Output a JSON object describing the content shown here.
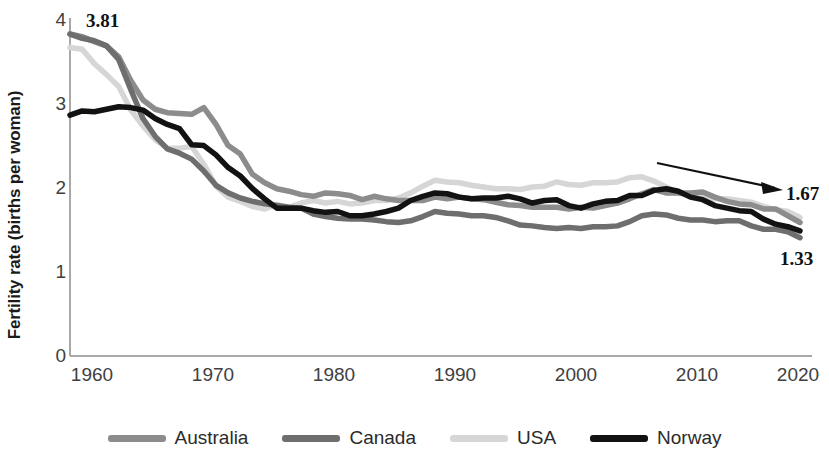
{
  "chart_data": {
    "type": "line",
    "title": "",
    "xlabel": "",
    "ylabel": "Fertility rate (births per woman)",
    "xlim": [
      1960,
      2020
    ],
    "ylim": [
      0,
      4
    ],
    "xticks": [
      "1960",
      "1970",
      "1980",
      "1990",
      "2000",
      "2010",
      "2020"
    ],
    "yticks": [
      "0",
      "1",
      "2",
      "3",
      "4"
    ],
    "grid": false,
    "legend_position": "bottom",
    "x": [
      1960,
      1961,
      1962,
      1963,
      1964,
      1965,
      1966,
      1967,
      1968,
      1969,
      1970,
      1971,
      1972,
      1973,
      1974,
      1975,
      1976,
      1977,
      1978,
      1979,
      1980,
      1981,
      1982,
      1983,
      1984,
      1985,
      1986,
      1987,
      1988,
      1989,
      1990,
      1991,
      1992,
      1993,
      1994,
      1995,
      1996,
      1997,
      1998,
      1999,
      2000,
      2001,
      2002,
      2003,
      2004,
      2005,
      2006,
      2007,
      2008,
      2009,
      2010,
      2011,
      2012,
      2013,
      2014,
      2015,
      2016,
      2017,
      2018,
      2019,
      2020
    ],
    "series": [
      {
        "name": "Australia",
        "color": "#8c8c8c",
        "values": [
          3.81,
          3.78,
          3.72,
          3.67,
          3.54,
          3.26,
          3.03,
          2.92,
          2.88,
          2.87,
          2.86,
          2.94,
          2.74,
          2.49,
          2.39,
          2.15,
          2.05,
          1.98,
          1.95,
          1.91,
          1.89,
          1.93,
          1.92,
          1.9,
          1.85,
          1.89,
          1.86,
          1.84,
          1.84,
          1.84,
          1.88,
          1.86,
          1.88,
          1.86,
          1.85,
          1.82,
          1.79,
          1.78,
          1.76,
          1.76,
          1.76,
          1.74,
          1.76,
          1.75,
          1.78,
          1.81,
          1.86,
          1.92,
          1.97,
          1.93,
          1.93,
          1.93,
          1.94,
          1.88,
          1.83,
          1.8,
          1.79,
          1.74,
          1.74,
          1.66,
          1.58
        ]
      },
      {
        "name": "Canada",
        "color": "#6e6e6e",
        "values": [
          3.81,
          3.76,
          3.73,
          3.67,
          3.51,
          3.15,
          2.81,
          2.6,
          2.45,
          2.4,
          2.33,
          2.19,
          2.02,
          1.93,
          1.87,
          1.83,
          1.8,
          1.78,
          1.76,
          1.75,
          1.68,
          1.65,
          1.63,
          1.62,
          1.62,
          1.61,
          1.59,
          1.58,
          1.6,
          1.65,
          1.71,
          1.69,
          1.68,
          1.66,
          1.66,
          1.64,
          1.6,
          1.55,
          1.54,
          1.52,
          1.51,
          1.52,
          1.51,
          1.53,
          1.53,
          1.54,
          1.59,
          1.66,
          1.68,
          1.67,
          1.63,
          1.61,
          1.61,
          1.59,
          1.6,
          1.6,
          1.54,
          1.5,
          1.5,
          1.47,
          1.4
        ]
      },
      {
        "name": "USA",
        "color": "#d6d6d6",
        "values": [
          3.65,
          3.63,
          3.46,
          3.33,
          3.19,
          2.91,
          2.72,
          2.56,
          2.46,
          2.46,
          2.48,
          2.27,
          2.01,
          1.88,
          1.83,
          1.77,
          1.74,
          1.79,
          1.76,
          1.81,
          1.84,
          1.81,
          1.83,
          1.8,
          1.81,
          1.84,
          1.84,
          1.87,
          1.93,
          2.01,
          2.08,
          2.06,
          2.05,
          2.02,
          2.0,
          1.98,
          1.98,
          1.97,
          2.0,
          2.01,
          2.06,
          2.03,
          2.02,
          2.05,
          2.05,
          2.06,
          2.11,
          2.12,
          2.07,
          2.0,
          1.93,
          1.89,
          1.88,
          1.86,
          1.86,
          1.84,
          1.82,
          1.77,
          1.73,
          1.71,
          1.64
        ]
      },
      {
        "name": "Norway",
        "color": "#121212",
        "values": [
          2.85,
          2.9,
          2.89,
          2.92,
          2.95,
          2.94,
          2.91,
          2.81,
          2.74,
          2.69,
          2.5,
          2.49,
          2.38,
          2.23,
          2.13,
          1.98,
          1.86,
          1.75,
          1.75,
          1.75,
          1.72,
          1.7,
          1.71,
          1.66,
          1.66,
          1.68,
          1.71,
          1.75,
          1.84,
          1.89,
          1.93,
          1.92,
          1.88,
          1.86,
          1.87,
          1.87,
          1.89,
          1.86,
          1.81,
          1.84,
          1.85,
          1.78,
          1.75,
          1.8,
          1.83,
          1.84,
          1.9,
          1.9,
          1.96,
          1.98,
          1.95,
          1.88,
          1.85,
          1.78,
          1.75,
          1.72,
          1.71,
          1.62,
          1.56,
          1.53,
          1.48
        ]
      }
    ],
    "annotations": [
      {
        "id": "start",
        "text": "3.81",
        "series": "Australia",
        "x": 1960,
        "y": 3.81
      },
      {
        "id": "end-norway",
        "text": "1.67",
        "series": "Norway",
        "x": 2020,
        "y": 1.67
      },
      {
        "id": "end-canada",
        "text": "1.33",
        "series": "Canada",
        "x": 2020,
        "y": 1.33
      },
      {
        "id": "trend-arrow",
        "text": "",
        "kind": "arrow",
        "direction": "down-right"
      }
    ]
  },
  "legend": {
    "items": [
      {
        "label": "Australia",
        "color": "#8c8c8c"
      },
      {
        "label": "Canada",
        "color": "#6e6e6e"
      },
      {
        "label": "USA",
        "color": "#d6d6d6"
      },
      {
        "label": "Norway",
        "color": "#121212"
      }
    ]
  },
  "axes": {
    "y_title": "Fertility rate (births per woman)",
    "y_ticks": [
      "4",
      "3",
      "2",
      "1",
      "0"
    ],
    "x_ticks": [
      "1960",
      "1970",
      "1980",
      "1990",
      "2000",
      "2010",
      "2020"
    ]
  }
}
